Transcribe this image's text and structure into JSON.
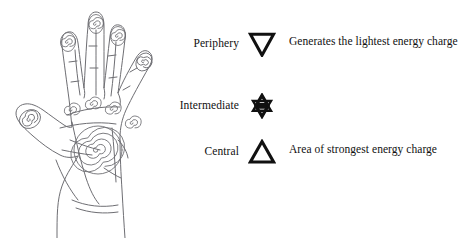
{
  "figure": {
    "illustration": {
      "name": "open hand palm with spirals",
      "description": "Line drawing of an open left hand, palm facing viewer, with spiral symbols at each fingertip, at the base of each finger, and one large spiral at the center of the palm",
      "spiral_counts": {
        "fingertip_spirals": 5,
        "intermediate_spirals": 4,
        "central_spirals": 1
      }
    }
  },
  "legend": {
    "rows": [
      {
        "label": "Periphery",
        "symbol": "down-triangle",
        "description": "Generates the lightest energy charge"
      },
      {
        "label": "Intermediate",
        "symbol": "hexagram-star",
        "description": ""
      },
      {
        "label": "Central",
        "symbol": "up-triangle",
        "description": "Area of strongest energy charge"
      }
    ]
  },
  "colors": {
    "ink": "#111111",
    "line": "#6e6e73",
    "background": "#ffffff"
  }
}
